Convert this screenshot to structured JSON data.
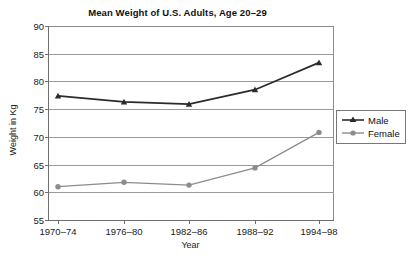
{
  "chart_data": {
    "type": "line",
    "title": "Mean Weight of U.S. Adults, Age 20–29",
    "xlabel": "Year",
    "ylabel": "Weight in Kg",
    "categories": [
      "1970–74",
      "1976–80",
      "1982–86",
      "1988–92",
      "1994–98"
    ],
    "series": [
      {
        "name": "Male",
        "marker": "triangle",
        "color": "#2b2b2b",
        "values": [
          77.4,
          76.3,
          75.9,
          78.5,
          83.4
        ]
      },
      {
        "name": "Female",
        "marker": "circle",
        "color": "#8c8c8c",
        "values": [
          61.0,
          61.8,
          61.3,
          64.4,
          70.8
        ]
      }
    ],
    "ylim": [
      55,
      90
    ],
    "yticks": [
      55,
      60,
      65,
      70,
      75,
      80,
      85,
      90
    ],
    "ytick_labels": [
      "55",
      "60",
      "65",
      "70",
      "75",
      "80",
      "85",
      "90"
    ],
    "grid": true,
    "legend_position": "right"
  },
  "legend": {
    "items": [
      {
        "label": "Male"
      },
      {
        "label": "Female"
      }
    ]
  }
}
